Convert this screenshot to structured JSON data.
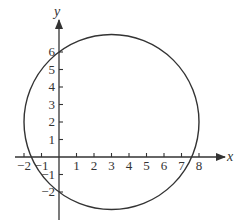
{
  "chart_data": {
    "type": "line",
    "title": "",
    "xlabel": "x",
    "ylabel": "y",
    "x_ticks": [
      "-2",
      "-1",
      "1",
      "2",
      "3",
      "4",
      "5",
      "6",
      "7",
      "8"
    ],
    "y_ticks": [
      "-2",
      "-1",
      "1",
      "2",
      "3",
      "4",
      "5",
      "6"
    ],
    "xlim": [
      -2.5,
      9
    ],
    "ylim": [
      -3,
      7.5
    ],
    "grid": false,
    "series": [
      {
        "name": "circle",
        "shape": "circle",
        "center": [
          3,
          2
        ],
        "radius": 5,
        "equation": "(x-3)^2 + (y-2)^2 = 25"
      }
    ]
  },
  "axes": {
    "x_label": "x",
    "y_label": "y"
  },
  "colors": {
    "stroke": "#333333",
    "background": "#ffffff"
  }
}
